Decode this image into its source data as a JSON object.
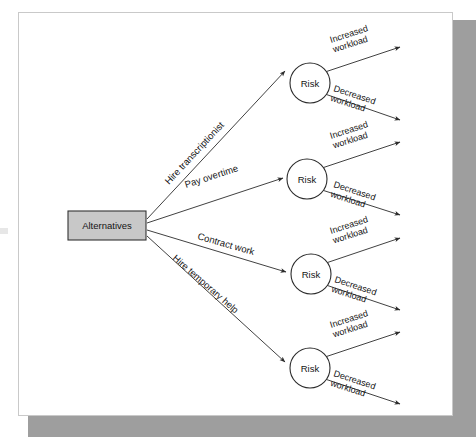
{
  "figure": {
    "type": "decision-tree-diagram",
    "root": {
      "label": "Alternatives",
      "shape": "rectangle",
      "fill": "#c8c8c8",
      "stroke": "#333333"
    },
    "chance_node_label": "Risk",
    "chance_node_shape": "circle",
    "chance_node_fill": "#ffffff",
    "chance_node_stroke": "#2b2b2b",
    "outcome_labels": [
      "Increased workload",
      "Decreased workload"
    ],
    "branches": [
      {
        "label": "Hire transcriptionist",
        "node": "Risk",
        "outcomes": [
          "Increased workload",
          "Decreased workload"
        ]
      },
      {
        "label": "Pay overtime",
        "node": "Risk",
        "outcomes": [
          "Increased workload",
          "Decreased workload"
        ]
      },
      {
        "label": "Contract work",
        "node": "Risk",
        "outcomes": [
          "Increased workload",
          "Decreased workload"
        ]
      },
      {
        "label": "Hire temporary help",
        "node": "Risk",
        "outcomes": [
          "Increased workload",
          "Decreased workload"
        ]
      }
    ],
    "outcome_line1": "Increased",
    "outcome_line2": "workload",
    "outcome2_line1": "Decreased",
    "outcome2_line2": "workload",
    "colors": {
      "page_background": "#ffffff",
      "panel_background": "#ffffff",
      "panel_border": "#c9c9c9",
      "shadow": "#9e9e9e",
      "line": "#2b2b2b",
      "text": "#141414",
      "root_fill": "#c8c8c8"
    }
  }
}
